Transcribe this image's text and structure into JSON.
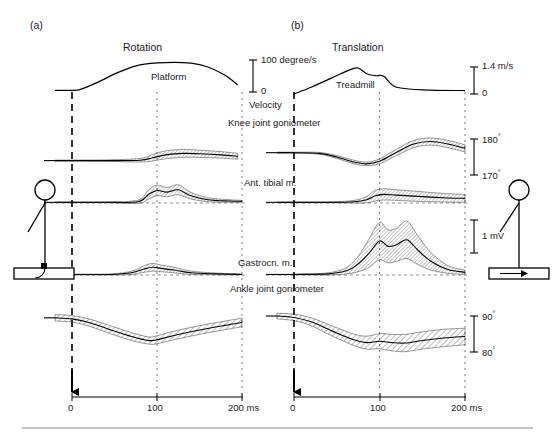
{
  "figure": {
    "panels": [
      {
        "key": "a",
        "letter": "(a)",
        "condition_title": "Rotation",
        "stimulus_label": "Platform",
        "stimulus_icon": "stick-figure-on-rotating-platform"
      },
      {
        "key": "b",
        "letter": "(b)",
        "condition_title": "Translation",
        "stimulus_label": "Treadmill",
        "stimulus_icon": "stick-figure-on-translating-platform"
      }
    ],
    "common_labels": {
      "velocity": "Velocity",
      "knee": "Knee joint goniometer",
      "ant_tibial": "Ant. tibial m.",
      "gastrocnemius": "Gastrocn. m.",
      "ankle": "Ankle joint goniometer"
    },
    "scales": {
      "rotation_velocity": {
        "top": "100  degree/s",
        "bottom": "0"
      },
      "translation_velocity": {
        "top": "1.4  m/s",
        "bottom": "0"
      },
      "knee_angle": {
        "top": "180",
        "top_unit": "°",
        "bottom": "170",
        "bottom_unit": "°"
      },
      "emg": {
        "label": "1  mV"
      },
      "ankle_angle": {
        "top": "90",
        "top_unit": "°",
        "bottom": "80",
        "bottom_unit": "°"
      }
    },
    "time_axis": {
      "ticks": [
        {
          "value": 0,
          "label": "0"
        },
        {
          "value": 100,
          "label": "100"
        },
        {
          "value": 200,
          "label": "200 ms"
        }
      ],
      "onset_marker": "downward-arrow-at-zero",
      "gridlines_ms": [
        0,
        100,
        200
      ]
    }
  },
  "chart_data": {
    "type": "line",
    "xlabel": "time (ms)",
    "ylabel": "",
    "xlim": [
      -20,
      215
    ],
    "grid": true,
    "legend": "none",
    "panels": [
      {
        "name": "Rotation",
        "traces": [
          {
            "name": "Platform velocity",
            "units": "degree/s",
            "ylim": [
              0,
              100
            ],
            "band": false,
            "x": [
              -20,
              0,
              10,
              30,
              55,
              80,
              110,
              140,
              160,
              180,
              195
            ],
            "y": [
              5,
              5,
              8,
              30,
              62,
              85,
              92,
              90,
              78,
              52,
              22
            ]
          },
          {
            "name": "Knee joint goniometer",
            "units": "degrees",
            "ylim": [
              170,
              180
            ],
            "band": true,
            "x": [
              -20,
              0,
              40,
              80,
              95,
              110,
              130,
              150,
              175,
              195
            ],
            "y": [
              174.0,
              174.0,
              174.0,
              174.1,
              174.8,
              175.6,
              176.0,
              175.9,
              175.6,
              175.2
            ],
            "band_halfwidth": [
              0.15,
              0.15,
              0.2,
              0.5,
              0.9,
              1.1,
              1.1,
              1.0,
              0.9,
              0.8
            ]
          },
          {
            "name": "Ant. tibial m.",
            "units": "mV",
            "ylim": [
              0,
              1
            ],
            "band": true,
            "x": [
              -20,
              0,
              40,
              78,
              90,
              100,
              112,
              125,
              140,
              160,
              185,
              200
            ],
            "y": [
              0.02,
              0.02,
              0.02,
              0.04,
              0.26,
              0.38,
              0.33,
              0.4,
              0.22,
              0.1,
              0.06,
              0.05
            ],
            "band_halfwidth": [
              0.01,
              0.01,
              0.01,
              0.05,
              0.14,
              0.16,
              0.14,
              0.15,
              0.1,
              0.06,
              0.04,
              0.03
            ]
          },
          {
            "name": "Gastrocn. m.",
            "units": "mV",
            "ylim": [
              0,
              1
            ],
            "band": true,
            "x": [
              -20,
              0,
              45,
              70,
              85,
              95,
              105,
              120,
              140,
              170,
              200
            ],
            "y": [
              0.01,
              0.01,
              0.01,
              0.04,
              0.11,
              0.14,
              0.12,
              0.09,
              0.04,
              0.02,
              0.01
            ],
            "band_halfwidth": [
              0.005,
              0.005,
              0.01,
              0.03,
              0.06,
              0.07,
              0.06,
              0.05,
              0.03,
              0.015,
              0.01
            ]
          },
          {
            "name": "Ankle joint goniometer",
            "units": "degrees",
            "ylim": [
              80,
              90
            ],
            "band": true,
            "x": [
              -20,
              0,
              20,
              45,
              70,
              90,
              100,
              120,
              150,
              180,
              200
            ],
            "y": [
              89.5,
              89.2,
              88.2,
              86.2,
              84.3,
              83.2,
              83.4,
              84.6,
              86.1,
              87.4,
              88.2
            ],
            "band_halfwidth": [
              0.9,
              0.9,
              1.0,
              1.1,
              1.1,
              1.0,
              1.1,
              1.2,
              1.2,
              1.2,
              1.2
            ]
          }
        ]
      },
      {
        "name": "Translation",
        "traces": [
          {
            "name": "Treadmill velocity",
            "units": "m/s",
            "ylim": [
              0,
              1.4
            ],
            "band": false,
            "x": [
              0,
              20,
              45,
              65,
              75,
              85,
              95,
              105,
              120,
              160,
              200
            ],
            "y": [
              0.0,
              0.35,
              0.85,
              1.25,
              1.35,
              1.05,
              0.95,
              0.92,
              0.35,
              0.2,
              0.18
            ]
          },
          {
            "name": "Knee joint goniometer",
            "units": "degrees",
            "ylim": [
              170,
              180
            ],
            "band": true,
            "x": [
              -20,
              0,
              30,
              50,
              70,
              85,
              100,
              120,
              140,
              160,
              180,
              200
            ],
            "y": [
              176.2,
              176.2,
              176.0,
              175.0,
              173.6,
              173.1,
              173.8,
              176.3,
              178.6,
              179.3,
              178.6,
              177.4
            ],
            "band_halfwidth": [
              0.15,
              0.15,
              0.25,
              0.4,
              0.5,
              0.5,
              0.7,
              0.9,
              1.0,
              1.0,
              1.0,
              1.0
            ]
          },
          {
            "name": "Ant. tibial m.",
            "units": "mV",
            "ylim": [
              0,
              1
            ],
            "band": true,
            "x": [
              -20,
              0,
              40,
              70,
              85,
              95,
              105,
              120,
              145,
              175,
              200
            ],
            "y": [
              0.02,
              0.02,
              0.02,
              0.04,
              0.1,
              0.22,
              0.26,
              0.24,
              0.2,
              0.16,
              0.14
            ],
            "band_halfwidth": [
              0.01,
              0.01,
              0.01,
              0.04,
              0.1,
              0.16,
              0.17,
              0.16,
              0.15,
              0.13,
              0.12
            ]
          },
          {
            "name": "Gastrocn. m.",
            "units": "mV",
            "ylim": [
              0,
              1
            ],
            "band": true,
            "x": [
              -20,
              0,
              40,
              62,
              75,
              88,
              100,
              110,
              120,
              132,
              145,
              160,
              180,
              200
            ],
            "y": [
              0.01,
              0.01,
              0.02,
              0.08,
              0.2,
              0.4,
              0.62,
              0.52,
              0.55,
              0.64,
              0.45,
              0.25,
              0.1,
              0.05
            ],
            "band_halfwidth": [
              0.005,
              0.005,
              0.02,
              0.06,
              0.14,
              0.26,
              0.34,
              0.3,
              0.3,
              0.34,
              0.26,
              0.16,
              0.07,
              0.04
            ]
          },
          {
            "name": "Ankle joint goniometer",
            "units": "degrees",
            "ylim": [
              80,
              90
            ],
            "band": true,
            "x": [
              -20,
              0,
              20,
              45,
              70,
              85,
              100,
              115,
              130,
              150,
              175,
              200
            ],
            "y": [
              90.0,
              89.6,
              88.4,
              85.8,
              83.4,
              82.6,
              83.0,
              82.6,
              82.5,
              83.2,
              83.9,
              84.3
            ],
            "band_halfwidth": [
              0.8,
              0.9,
              1.1,
              1.4,
              1.6,
              1.8,
              2.1,
              2.3,
              2.4,
              2.4,
              2.4,
              2.3
            ]
          }
        ]
      }
    ]
  }
}
